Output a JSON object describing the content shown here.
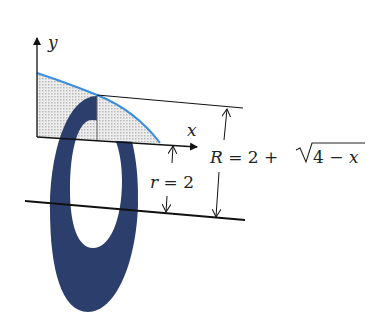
{
  "figure": {
    "axes": {
      "x_label": "x",
      "y_label": "y"
    },
    "labels": {
      "inner_radius": "r = 2",
      "outer_radius_prefix": "R = 2 + ",
      "outer_radius_radicand": "4 − x",
      "r_var": "r",
      "r_eq": " = 2",
      "R_var": "R",
      "R_eq": " = 2 + ",
      "radicand_num": "4 − ",
      "radicand_var": "x"
    },
    "colors": {
      "washer": "#2c3e6b",
      "curve": "#3a8ee0",
      "shading": "#d8d8d8",
      "lines": "#111111",
      "background": "#ffffff"
    }
  }
}
